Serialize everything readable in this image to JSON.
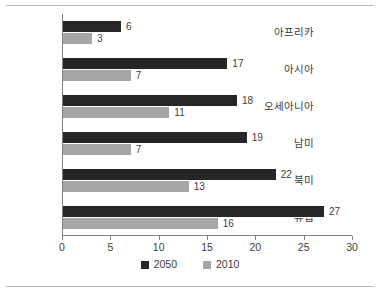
{
  "chart_data": {
    "type": "bar",
    "orientation": "horizontal",
    "title": "",
    "xlabel": "",
    "ylabel": "",
    "xlim": [
      0,
      30
    ],
    "xticks": [
      0,
      5,
      10,
      15,
      20,
      25,
      30
    ],
    "grid": false,
    "legend_position": "bottom-center",
    "categories": [
      "아프리카",
      "아시아",
      "오세아니아",
      "남미",
      "북미",
      "유럽"
    ],
    "series": [
      {
        "name": "2050",
        "color": "#262626",
        "values": [
          6,
          17,
          18,
          19,
          22,
          27
        ]
      },
      {
        "name": "2010",
        "color": "#a6a6a6",
        "values": [
          3,
          7,
          11,
          7,
          13,
          16
        ]
      }
    ]
  },
  "legend": {
    "items": [
      {
        "label": "2050",
        "color": "#262626"
      },
      {
        "label": "2010",
        "color": "#a6a6a6"
      }
    ]
  }
}
